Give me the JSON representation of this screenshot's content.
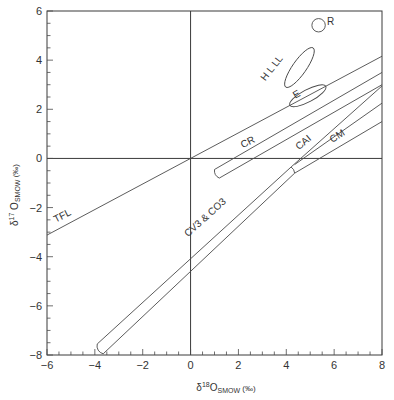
{
  "chart_data": {
    "type": "scatter",
    "title": "",
    "xlabel": "δ18O SMOW (‰)",
    "ylabel": "δ17O SMOW (‰)",
    "xlim": [
      -6,
      8
    ],
    "ylim": [
      -8,
      6
    ],
    "x_ticks": [
      -6,
      -4,
      -2,
      0,
      2,
      4,
      6,
      8
    ],
    "y_ticks": [
      -8,
      -6,
      -4,
      -2,
      0,
      2,
      4,
      6
    ],
    "x_tick_labels": [
      "−6",
      "−4",
      "−2",
      "0",
      "2",
      "4",
      "6",
      "8"
    ],
    "y_tick_labels": [
      "−8",
      "−6",
      "−4",
      "−2",
      "0",
      "2",
      "4",
      "6"
    ],
    "grid": false,
    "reference_lines": [
      {
        "name": "x=0",
        "x": [
          0,
          0
        ],
        "y": [
          -8,
          6
        ]
      },
      {
        "name": "y=0",
        "x": [
          -6,
          8
        ],
        "y": [
          0,
          0
        ]
      }
    ],
    "lines": [
      {
        "name": "TFL",
        "label": "TFL",
        "x": [
          -6,
          8
        ],
        "y": [
          -3.12,
          4.16
        ]
      },
      {
        "name": "CR-upper",
        "x": [
          1.0,
          8
        ],
        "y": [
          -0.45,
          3.5
        ]
      },
      {
        "name": "CR-lower",
        "x": [
          1.2,
          8
        ],
        "y": [
          -0.8,
          3.0
        ]
      },
      {
        "name": "CV3-upper",
        "x": [
          -3.9,
          4.2
        ],
        "y": [
          -7.55,
          -0.35
        ]
      },
      {
        "name": "CV3-lower",
        "x": [
          -3.65,
          4.35
        ],
        "y": [
          -7.95,
          -0.6
        ]
      },
      {
        "name": "CAI",
        "label": "CAI",
        "x": [
          4.2,
          8
        ],
        "y": [
          -0.35,
          2.95
        ]
      },
      {
        "name": "CM-upper",
        "x": [
          4.35,
          8
        ],
        "y": [
          -0.25,
          2.25
        ]
      },
      {
        "name": "CM-lower",
        "x": [
          4.35,
          8
        ],
        "y": [
          -0.6,
          1.5
        ]
      }
    ],
    "regions": [
      {
        "name": "CR",
        "label": "CR",
        "shape": "band",
        "from": [
          1.1,
          -0.62
        ],
        "to": [
          8,
          3.25
        ]
      },
      {
        "name": "CV3 & CO3",
        "label": "CV3 & CO3",
        "shape": "band",
        "from": [
          -3.8,
          -7.75
        ],
        "to": [
          4.3,
          -0.5
        ]
      },
      {
        "name": "CM",
        "label": "CM",
        "shape": "band",
        "from": [
          4.3,
          -0.45
        ],
        "to": [
          8,
          1.9
        ]
      },
      {
        "name": "H L LL",
        "label": "H L LL",
        "shape": "ellipse",
        "center": [
          4.55,
          3.7
        ],
        "rx": 1.0,
        "ry": 0.28,
        "angle_deg": -55
      },
      {
        "name": "E",
        "label": "E",
        "shape": "ellipse",
        "center": [
          4.9,
          2.55
        ],
        "rx": 0.85,
        "ry": 0.25,
        "angle_deg": -28
      },
      {
        "name": "R",
        "label": "R",
        "shape": "circle",
        "center": [
          5.35,
          5.42
        ],
        "r": 0.28
      }
    ],
    "annotations": [
      {
        "text": "TFL",
        "x": -5.3,
        "y": -2.45
      },
      {
        "text": "CR",
        "x": 2.45,
        "y": 0.55
      },
      {
        "text": "CAI",
        "x": 4.8,
        "y": 0.55
      },
      {
        "text": "CM",
        "x": 6.2,
        "y": 0.8
      },
      {
        "text": "CV3 & CO3",
        "x": 0.7,
        "y": -2.5
      },
      {
        "text": "H L LL",
        "x": 3.5,
        "y": 3.6
      },
      {
        "text": "E",
        "x": 4.5,
        "y": 2.5
      },
      {
        "text": "R",
        "x": 5.85,
        "y": 5.45
      }
    ]
  },
  "axes": {
    "x_label_prefix": "δ",
    "x_label_sup": "18",
    "x_label_main": "O",
    "x_label_sub": "SMOW",
    "x_label_unit": " (‰)",
    "y_label_prefix": "δ",
    "y_label_sup": "17",
    "y_label_main": " O",
    "y_label_sub": "SMOW",
    "y_label_unit": " (‰)"
  }
}
